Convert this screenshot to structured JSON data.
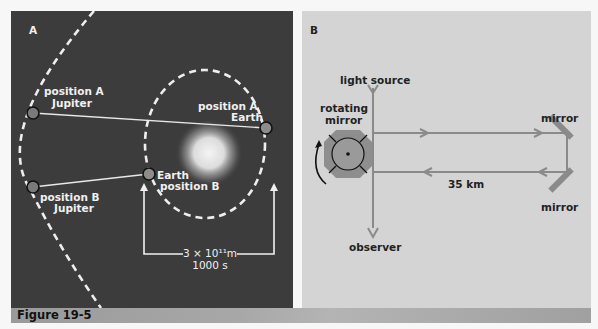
{
  "figure": {
    "caption": "Figure 19-5",
    "panel_a": {
      "label": "A",
      "jupiter_a_line1": "position A",
      "jupiter_a_line2": "Jupiter",
      "earth_a_line1": "position A",
      "earth_a_line2": "Earth",
      "earth_b_line1": "Earth",
      "earth_b_line2": "position B",
      "jupiter_b_line1": "position B",
      "jupiter_b_line2": "Jupiter",
      "distance_label": "3 × 10¹¹m",
      "time_label": "1000 s"
    },
    "panel_b": {
      "label": "B",
      "light_source": "light source",
      "rotating_mirror_line1": "rotating",
      "rotating_mirror_line2": "mirror",
      "mirror_top": "mirror",
      "mirror_bottom": "mirror",
      "distance": "35 km",
      "observer": "observer"
    },
    "colors": {
      "panel_a_bg": "#3c3c3c",
      "panel_b_bg": "#d4d4d4",
      "beam": "#8a8a8a",
      "caption_bar": "#a4a4a4"
    }
  }
}
